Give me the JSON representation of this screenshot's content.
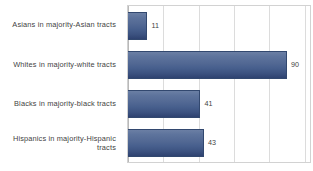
{
  "chart_data": {
    "type": "bar",
    "orientation": "horizontal",
    "title": "",
    "subtitle": "",
    "xlabel": "",
    "ylabel": "",
    "categories": [
      "Asians in majority-Asian tracts",
      "Whites in majority-white tracts",
      "Blacks in majority-black tracts",
      "Hispanics in majority-Hispanic tracts"
    ],
    "values": [
      11,
      90,
      41,
      43
    ],
    "data_labels": [
      "11",
      "90",
      "41",
      "43"
    ],
    "xlim": [
      0,
      103
    ],
    "gridlines": [
      20,
      40,
      60,
      80,
      100
    ],
    "grid": true,
    "legend": false,
    "tick_labels": [],
    "bar_color": "#4a6091",
    "bar_gradient_top": "#6b7fa4",
    "bar_gradient_bottom": "#2e4270",
    "bar_border_color": "#32486f",
    "grid_color": "#dcdcdc",
    "frame_color": "#d2d2d2",
    "text_color": "#3f3f3f",
    "background": "#ffffff"
  }
}
